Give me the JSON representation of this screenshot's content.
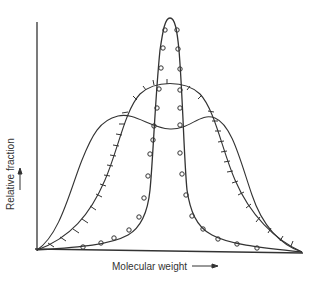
{
  "figure": {
    "y_axis_label": "Relative fraction",
    "x_axis_label": "Molecular weight",
    "line_color": "#333333"
  },
  "curves": [
    {
      "name": "narrow-distribution",
      "marker": "circle"
    },
    {
      "name": "medium-distribution",
      "marker": "tick"
    },
    {
      "name": "broad-bimodal-distribution",
      "marker": "none"
    }
  ]
}
